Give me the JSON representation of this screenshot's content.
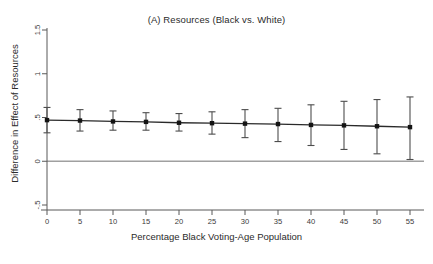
{
  "chart_data": {
    "type": "scatter",
    "title": "(A) Resources (Black vs. White)",
    "xlabel": "Percentage Black Voting-Age Population",
    "ylabel": "Difference in Effect of Resources",
    "grid": false,
    "legend": "none",
    "xlim": [
      0,
      55
    ],
    "ylim": [
      -0.5,
      1.5
    ],
    "xticks": [
      0,
      5,
      10,
      15,
      20,
      25,
      30,
      35,
      40,
      45,
      50,
      55
    ],
    "xtick_labels": [
      "0",
      "5",
      "10",
      "15",
      "20",
      "25",
      "30",
      "35",
      "40",
      "45",
      "50",
      "55"
    ],
    "yticks": [
      -0.5,
      0,
      0.5,
      1,
      1.5
    ],
    "ytick_labels": [
      "-.5",
      "0",
      ".5",
      "1",
      "1.5"
    ],
    "reference_line": {
      "y": 0,
      "color": "#a0a0a0"
    },
    "x": [
      0,
      5,
      10,
      15,
      20,
      25,
      30,
      35,
      40,
      45,
      50,
      55
    ],
    "values": [
      0.47,
      0.465,
      0.455,
      0.45,
      0.44,
      0.435,
      0.43,
      0.425,
      0.415,
      0.41,
      0.4,
      0.39
    ],
    "ci_low": [
      0.325,
      0.345,
      0.355,
      0.355,
      0.345,
      0.31,
      0.27,
      0.225,
      0.18,
      0.135,
      0.085,
      0.02
    ],
    "ci_high": [
      0.615,
      0.59,
      0.575,
      0.555,
      0.545,
      0.565,
      0.59,
      0.605,
      0.645,
      0.685,
      0.705,
      0.735
    ],
    "marker_color": "#141414",
    "line_color": "#2a2a2a",
    "errorbar_color": "#4d4d4d"
  }
}
